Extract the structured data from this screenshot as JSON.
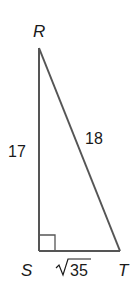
{
  "diagram": {
    "type": "right-triangle",
    "vertices": {
      "R": {
        "label": "R"
      },
      "S": {
        "label": "S"
      },
      "T": {
        "label": "T"
      }
    },
    "sides": {
      "RS": {
        "label": "17"
      },
      "RT": {
        "label": "18"
      },
      "ST": {
        "label": "35",
        "radical": true
      }
    },
    "right_angle_at": "S",
    "colors": {
      "stroke": "#555555",
      "text": "#1a1a1a"
    }
  }
}
